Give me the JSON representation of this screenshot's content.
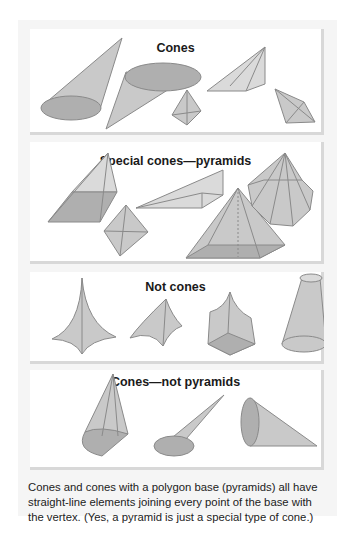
{
  "panels": [
    {
      "title": "Cones",
      "shapes": [
        "circular-cone-left",
        "circular-cone-inverted",
        "small-tetrahedral-pyramid",
        "skewed-triangular-pyramid",
        "tilted-quadrilateral-pyramid"
      ]
    },
    {
      "title": "Special cones—pyramids",
      "shapes": [
        "square-pyramid-oblique",
        "rhombus-pyramid-small",
        "thin-triangular-pyramid",
        "square-pyramid-right-with-height",
        "octagonal-pyramid"
      ]
    },
    {
      "title": "Not cones",
      "shapes": [
        "curved-four-point-shape",
        "curved-triangular-shape",
        "curved-square-base-shape",
        "frustum"
      ]
    },
    {
      "title": "Cones—not pyramids",
      "shapes": [
        "cone-mixed-base",
        "oblique-circular-cone",
        "cone-on-side"
      ]
    }
  ],
  "caption": "Cones and cones with a polygon base (pyramids) all have straight-line elements joining every point of the base with the vertex. (Yes, a pyramid is just a special type of cone.)",
  "colors": {
    "side": "#c9c9c9",
    "base": "#afafaf",
    "edge": "#8a8a8a",
    "frame": "#f5f5f5",
    "panel": "#ffffff"
  }
}
